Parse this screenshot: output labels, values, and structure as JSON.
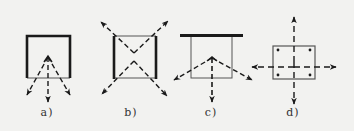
{
  "figure": {
    "background": "#f2f2f0",
    "line_color": "#1a1a1a",
    "panels": [
      {
        "id": "a",
        "label": "a)",
        "description": "box open at bottom (thick top/left/right, thin bottom) with three dashed arrows radiating downward from an interior apex",
        "label_x": 47
      },
      {
        "id": "b",
        "label": "b)",
        "description": "box with thick left/right sides and thin top/bottom; four dashed diagonal arrows crossing inside and pointing out to the corners",
        "label_x": 131
      },
      {
        "id": "c",
        "label": "c)",
        "description": "thick horizontal bar above a thin box; three dashed arrows radiating downward/outward from an interior apex",
        "label_x": 211
      },
      {
        "id": "d",
        "label": "d)",
        "description": "thin square with dots at four corners; dashed cross through center with arrows pointing up, down, left and right",
        "label_x": 293
      }
    ]
  }
}
